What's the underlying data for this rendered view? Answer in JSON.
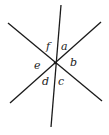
{
  "diagram": {
    "title": "",
    "colors": {
      "line": "#1a1a1a",
      "label": "#222222",
      "background": "#ffffff"
    },
    "lines": [
      {
        "id": "line-near-vertical",
        "x1": 61,
        "y1": 5,
        "x2": 51,
        "y2": 127
      },
      {
        "id": "line-descending-diagonal",
        "x1": 8,
        "y1": 23,
        "x2": 102,
        "y2": 101
      },
      {
        "id": "line-ascending-diagonal",
        "x1": 10,
        "y1": 103,
        "x2": 101,
        "y2": 22
      }
    ],
    "intersection": {
      "x": 55,
      "y": 63
    },
    "angle_labels": [
      {
        "text": "a",
        "x": 61,
        "y": 50
      },
      {
        "text": "b",
        "x": 70,
        "y": 66
      },
      {
        "text": "c",
        "x": 58,
        "y": 85
      },
      {
        "text": "d",
        "x": 42,
        "y": 85
      },
      {
        "text": "e",
        "x": 34,
        "y": 69
      },
      {
        "text": "f",
        "x": 46,
        "y": 50
      }
    ]
  }
}
